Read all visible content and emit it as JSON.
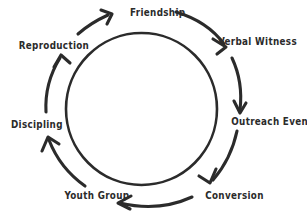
{
  "diagram": {
    "type": "cycle-diagram",
    "direction": "clockwise",
    "colors": {
      "ink": "#2b2b2b",
      "background": "#ffffff"
    },
    "geometry": {
      "center_x": 141,
      "center_y": 109,
      "inner_circle_radius": 75,
      "arrow_ring_radius": 97
    },
    "stages": [
      {
        "id": "friendship",
        "label": "Friendship",
        "position": "top"
      },
      {
        "id": "verbal-witness",
        "label": "Verbal Witness",
        "position": "upper-right"
      },
      {
        "id": "outreach-events",
        "label": "Outreach Events",
        "position": "right"
      },
      {
        "id": "conversion",
        "label": "Conversion",
        "position": "lower-right"
      },
      {
        "id": "youth-group",
        "label": "Youth Group",
        "position": "lower-left"
      },
      {
        "id": "discipling",
        "label": "Discipling",
        "position": "left"
      },
      {
        "id": "reproduction",
        "label": "Reproduction",
        "position": "upper-left"
      }
    ]
  }
}
